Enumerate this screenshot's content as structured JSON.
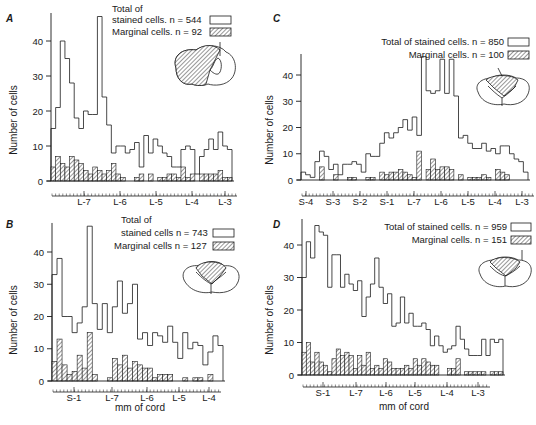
{
  "figure": {
    "ylabel": "Number of cells",
    "xlabel": "mm of cord"
  },
  "colors": {
    "ink": "#1a1a1a",
    "background": "#ffffff"
  },
  "chart_data": [
    {
      "panel": "A",
      "type": "bar",
      "subtype": "histogram-step",
      "xlabel": "",
      "ylabel": "Number of cells",
      "yticks": [
        0,
        10,
        20,
        30,
        40
      ],
      "ylim": [
        0,
        47
      ],
      "xtick_labels": [
        "L-7",
        "L-6",
        "L-5",
        "L-4",
        "L-3"
      ],
      "legend": [
        {
          "label": "Total of stained cells. n = 544",
          "line1": "Total of",
          "line2": "stained cells. n = 544",
          "style": "open"
        },
        {
          "label": "Marginal cells. n = 92",
          "style": "hatched"
        }
      ],
      "series": [
        {
          "name": "Total of stained cells",
          "n": 544,
          "values": [
            15,
            21,
            40,
            35,
            28,
            18,
            15,
            20,
            19,
            19,
            47,
            24,
            16,
            8,
            10,
            10,
            8,
            9,
            11,
            4,
            13,
            8,
            12,
            10,
            8,
            7,
            4,
            4,
            9,
            10,
            9,
            2,
            7,
            9,
            12,
            9,
            14,
            10,
            9
          ]
        },
        {
          "name": "Marginal cells",
          "n": 92,
          "values": [
            4,
            7,
            5,
            4,
            7,
            6,
            5,
            3,
            2,
            4,
            3,
            2,
            3,
            5,
            2,
            1,
            0,
            0,
            1,
            2,
            0,
            2,
            0,
            1,
            1,
            2,
            2,
            1,
            4,
            1,
            2,
            0,
            2,
            2,
            2,
            2,
            3,
            1,
            1
          ]
        }
      ],
      "inset": "spinal-cord-cross-section-dorsolateral-hatched"
    },
    {
      "panel": "B",
      "type": "bar",
      "subtype": "histogram-step",
      "xlabel": "mm of cord",
      "ylabel": "Number of cells",
      "yticks": [
        0,
        10,
        20,
        30,
        40
      ],
      "ylim": [
        0,
        48
      ],
      "xtick_labels": [
        "S-1",
        "L-7",
        "L-6",
        "L-5",
        "L-4"
      ],
      "legend": [
        {
          "label": "Total of stained cells n = 743",
          "line1": "Total of",
          "line2": "stained cells n = 743",
          "style": "open"
        },
        {
          "label": "Marginal cells n = 127",
          "style": "hatched"
        }
      ],
      "series": [
        {
          "name": "Total of stained cells",
          "n": 743,
          "values": [
            33,
            38,
            20,
            20,
            15,
            18,
            23,
            48,
            24,
            16,
            24,
            15,
            23,
            31,
            21,
            24,
            30,
            13,
            15,
            11,
            15,
            14,
            12,
            17,
            12,
            7,
            15,
            10,
            12,
            11,
            5,
            9,
            14,
            11
          ]
        },
        {
          "name": "Marginal cells",
          "n": 127,
          "values": [
            6,
            13,
            5,
            2,
            3,
            8,
            4,
            15,
            2,
            0,
            0,
            1,
            7,
            5,
            8,
            4,
            6,
            5,
            4,
            4,
            1,
            2,
            2,
            2,
            0,
            0,
            1,
            0,
            1,
            1,
            0,
            2,
            0,
            0
          ]
        }
      ],
      "inset": "spinal-cord-cross-section-dorsal-hatched"
    },
    {
      "panel": "C",
      "type": "bar",
      "subtype": "histogram-step",
      "xlabel": "",
      "ylabel": "Number of cells",
      "yticks": [
        0,
        10,
        20,
        30,
        40
      ],
      "ylim": [
        0,
        47
      ],
      "xtick_labels": [
        "S-4",
        "S-3",
        "S-2",
        "S-1",
        "L-7",
        "L-6",
        "L-5",
        "L-4",
        "L-3"
      ],
      "legend": [
        {
          "label": "Total of stained cells. n = 850",
          "style": "open"
        },
        {
          "label": "Marginal cells. n = 100",
          "style": "hatched"
        }
      ],
      "series": [
        {
          "name": "Total of stained cells",
          "n": 850,
          "values": [
            3,
            2,
            1,
            7,
            11,
            9,
            4,
            6,
            2,
            6,
            6,
            7,
            6,
            3,
            10,
            9,
            9,
            14,
            18,
            16,
            18,
            20,
            23,
            19,
            24,
            17,
            47,
            34,
            33,
            34,
            46,
            33,
            46,
            32,
            16,
            17,
            14,
            12,
            12,
            14,
            11,
            12,
            10,
            13,
            13,
            10,
            8,
            7,
            3
          ]
        },
        {
          "name": "Marginal cells",
          "n": 100,
          "values": [
            0,
            0,
            0,
            0,
            5,
            0,
            0,
            2,
            0,
            0,
            1,
            1,
            0,
            0,
            1,
            1,
            0,
            3,
            2,
            3,
            3,
            4,
            3,
            2,
            1,
            11,
            0,
            4,
            8,
            4,
            5,
            5,
            4,
            0,
            2,
            0,
            1,
            1,
            1,
            2,
            1,
            0,
            4,
            3,
            2,
            0,
            0,
            0,
            0
          ]
        }
      ],
      "inset": "spinal-cord-cross-section-dorsal-hatched"
    },
    {
      "panel": "D",
      "type": "bar",
      "subtype": "histogram-step",
      "xlabel": "mm of cord",
      "ylabel": "Number of cells",
      "yticks": [
        0,
        10,
        20,
        30,
        40
      ],
      "ylim": [
        0,
        47
      ],
      "xtick_labels": [
        "S-1",
        "L-7",
        "L-6",
        "L-5",
        "L-4",
        "L-3"
      ],
      "legend": [
        {
          "label": "Total of stained cells. n = 959",
          "style": "open"
        },
        {
          "label": "Marginal cells. n = 151",
          "style": "hatched"
        }
      ],
      "series": [
        {
          "name": "Total of stained cells",
          "n": 959,
          "values": [
            30,
            41,
            36,
            46,
            44,
            43,
            27,
            37,
            37,
            27,
            31,
            28,
            26,
            29,
            18,
            24,
            28,
            36,
            27,
            22,
            25,
            15,
            16,
            24,
            16,
            19,
            15,
            15,
            16,
            14,
            9,
            12,
            9,
            7,
            8,
            9,
            15,
            11,
            8,
            6,
            6,
            6,
            11,
            6,
            11,
            10,
            11
          ]
        },
        {
          "name": "Marginal cells",
          "n": 151,
          "values": [
            7,
            10,
            4,
            7,
            4,
            3,
            1,
            5,
            8,
            6,
            7,
            6,
            2,
            6,
            3,
            7,
            2,
            3,
            2,
            5,
            4,
            2,
            2,
            2,
            3,
            2,
            5,
            3,
            5,
            4,
            3,
            3,
            0,
            0,
            2,
            2,
            5,
            0,
            1,
            1,
            1,
            1,
            1,
            0,
            1,
            1,
            1
          ]
        }
      ],
      "inset": "spinal-cord-cross-section-dorsal-hatched"
    }
  ]
}
